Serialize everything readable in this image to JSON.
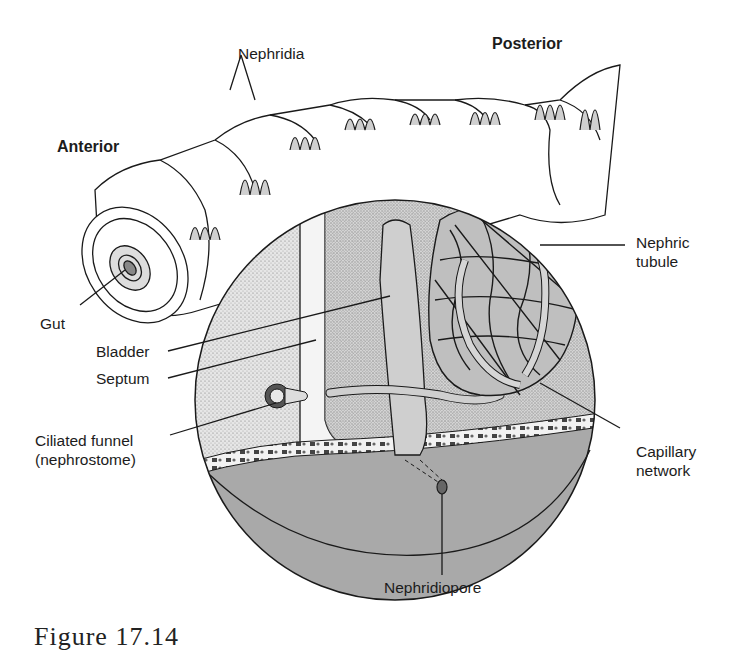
{
  "figure": {
    "caption": "Figure 17.14"
  },
  "labels": {
    "nephridia": "Nephridia",
    "posterior": "Posterior",
    "anterior": "Anterior",
    "nephric_tubule_1": "Nephric",
    "nephric_tubule_2": "tubule",
    "gut": "Gut",
    "bladder": "Bladder",
    "septum": "Septum",
    "ciliated_funnel_1": "Ciliated funnel",
    "ciliated_funnel_2": "(nephrostome)",
    "capillary_network_1": "Capillary",
    "capillary_network_2": "network",
    "nephridiopore": "Nephridiopore"
  },
  "colors": {
    "ink": "#1a1a1a",
    "stipple_light": "#d9d9d9",
    "stipple_mid": "#bdbdbd",
    "ventral_gray": "#a9a9a9",
    "tubule_fill": "#c8c8c8",
    "background": "#ffffff"
  }
}
